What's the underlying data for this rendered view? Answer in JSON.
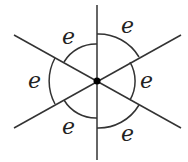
{
  "diagram": {
    "center": {
      "x": 97,
      "y": 81
    },
    "line_color": "#333333",
    "labels": [
      {
        "id": "top-left",
        "text": "e"
      },
      {
        "id": "top-right",
        "text": "e"
      },
      {
        "id": "left",
        "text": "e"
      },
      {
        "id": "right",
        "text": "e"
      },
      {
        "id": "bottom-left",
        "text": "e"
      },
      {
        "id": "bottom-right",
        "text": "e"
      }
    ]
  }
}
